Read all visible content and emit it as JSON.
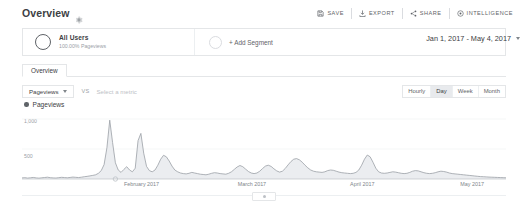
{
  "header": {
    "title": "Overview",
    "gear_icon": "gear-icon",
    "toolbar": [
      {
        "label": "SAVE",
        "icon": "save-icon"
      },
      {
        "label": "EXPORT",
        "icon": "export-icon"
      },
      {
        "label": "SHARE",
        "icon": "share-icon"
      },
      {
        "label": "INTELLIGENCE",
        "icon": "intelligence-icon"
      }
    ]
  },
  "segment_bar": {
    "segment": {
      "name": "All Users",
      "sub": "100.00% Pageviews"
    },
    "add_segment_label": "+ Add Segment"
  },
  "date_range": {
    "value": "Jan 1, 2017 - May 4, 2017",
    "caret_icon": "chevron-down-icon"
  },
  "tabs": [
    {
      "label": "Overview",
      "active": true
    }
  ],
  "metric_row": {
    "primary_metric": "Pageviews",
    "caret_icon": "chevron-down-icon",
    "vs_label": "VS",
    "secondary_placeholder": "Select a metric"
  },
  "granularity": {
    "options": [
      "Hourly",
      "Day",
      "Week",
      "Month"
    ],
    "selected": "Day"
  },
  "chart_data": {
    "type": "line",
    "title": "Pageviews",
    "legend": [
      "Pageviews"
    ],
    "legend_position": "top-left",
    "grid": true,
    "xlabel": "",
    "ylabel": "",
    "ylim": [
      0,
      1200
    ],
    "yticks": [
      500,
      1000
    ],
    "ytick_labels": [
      "500",
      "1,000"
    ],
    "xtick_labels": [
      "February 2017",
      "March 2017",
      "April 2017",
      "May 2017"
    ],
    "xtick_positions": [
      0.247,
      0.475,
      0.703,
      0.93
    ],
    "x_start": "Jan 1, 2017",
    "x_end": "May 4, 2017",
    "series": [
      {
        "name": "Pageviews",
        "color": "#9aa0a6",
        "values": [
          18,
          22,
          15,
          20,
          26,
          18,
          14,
          20,
          25,
          30,
          22,
          18,
          16,
          22,
          28,
          24,
          20,
          26,
          32,
          28,
          24,
          30,
          38,
          44,
          52,
          60,
          70,
          95,
          140,
          240,
          520,
          980,
          610,
          270,
          150,
          110,
          160,
          205,
          150,
          120,
          180,
          640,
          760,
          430,
          210,
          140,
          120,
          150,
          230,
          330,
          395,
          370,
          300,
          215,
          150,
          120,
          100,
          90,
          85,
          95,
          110,
          100,
          90,
          80,
          75,
          70,
          80,
          95,
          105,
          100,
          90,
          85,
          80,
          95,
          120,
          160,
          200,
          225,
          205,
          165,
          125,
          100,
          90,
          100,
          130,
          175,
          215,
          230,
          210,
          170,
          135,
          115,
          130,
          175,
          235,
          290,
          330,
          340,
          320,
          280,
          230,
          185,
          150,
          130,
          120,
          115,
          110,
          120,
          140,
          150,
          145,
          130,
          115,
          105,
          100,
          95,
          90,
          95,
          110,
          150,
          230,
          330,
          400,
          370,
          280,
          180,
          120,
          100,
          95,
          100,
          110,
          120,
          115,
          105,
          95,
          90,
          95,
          110,
          130,
          140,
          135,
          120,
          105,
          95,
          90,
          95,
          105,
          120,
          130,
          125,
          115,
          100,
          90,
          85,
          80,
          75,
          70,
          65,
          60,
          55,
          50,
          45,
          40,
          38,
          35,
          32,
          30,
          28,
          26,
          24,
          22,
          20
        ]
      }
    ]
  },
  "drag_handle": {
    "icon": "drag-handle-icon"
  }
}
